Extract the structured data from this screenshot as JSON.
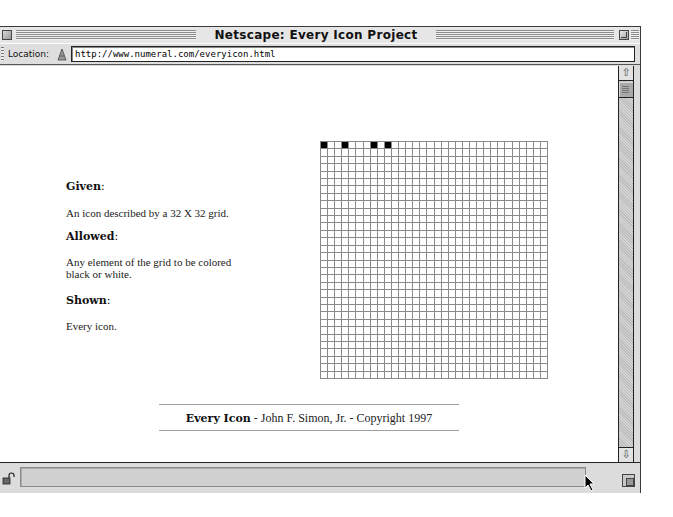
{
  "window": {
    "title": "Netscape: Every Icon Project Page"
  },
  "location_bar": {
    "label": "Location:",
    "icon": "bookmark-link-icon",
    "url": "http://www.numeral.com/everyicon.html"
  },
  "page": {
    "sections": [
      {
        "heading": "Given",
        "text": "An icon described by a 32 X 32 grid."
      },
      {
        "heading": "Allowed",
        "text": "Any element of the grid to be colored black or white."
      },
      {
        "heading": "Shown",
        "text": "Every icon."
      }
    ],
    "colon": ":",
    "grid": {
      "rows": 32,
      "cols": 32,
      "black_cells": [
        [
          0,
          0
        ],
        [
          0,
          3
        ],
        [
          0,
          7
        ],
        [
          0,
          9
        ]
      ]
    },
    "footer": {
      "title": "Every Icon",
      "credit": " - John F. Simon, Jr. - Copyright 1997"
    }
  },
  "scrollbar": {
    "up_icon": "⇧",
    "down_icon": "⇩"
  },
  "status_bar": {
    "text": "",
    "lock_icon": "🔓"
  }
}
